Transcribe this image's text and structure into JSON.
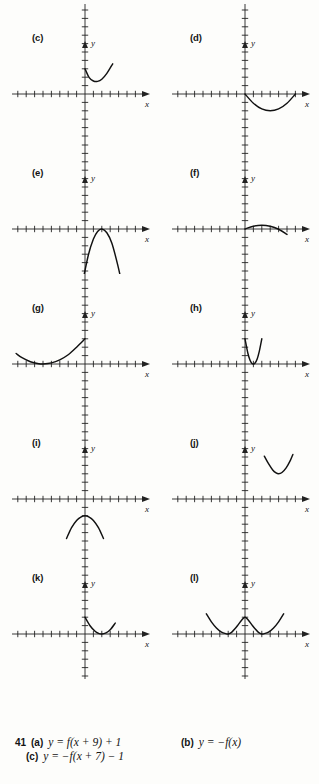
{
  "page": {
    "kind": "textbook-answer-figure",
    "grid": {
      "columns": 2,
      "rows": 6
    }
  },
  "axes_defaults": {
    "x_label": "x",
    "y_label": "y",
    "x_min": -8,
    "x_max": 8,
    "y_min": -8,
    "y_max": 8,
    "tick_spacing": 1,
    "grid": false
  },
  "panels": [
    {
      "id": "c",
      "label": "(c)",
      "chart": {
        "type": "line",
        "title": "",
        "xlabel": "x",
        "ylabel": "y",
        "xlim": [
          -8,
          8
        ],
        "ylim": [
          -8,
          8
        ],
        "description": "upward parabola, vertex near (1.5, 1.5), left end at (0, 3)",
        "vertex": [
          1.5,
          1.5
        ],
        "opens": "up",
        "x_domain": [
          0,
          3.3
        ],
        "a": 1.2,
        "points": [
          [
            0,
            3.0
          ],
          [
            0.5,
            1.95
          ],
          [
            1.0,
            1.55
          ],
          [
            1.5,
            1.5
          ],
          [
            2.0,
            1.75
          ],
          [
            2.6,
            2.45
          ],
          [
            3.3,
            3.6
          ]
        ]
      }
    },
    {
      "id": "d",
      "label": "(d)",
      "chart": {
        "type": "line",
        "title": "",
        "xlabel": "x",
        "ylabel": "y",
        "xlim": [
          -8,
          8
        ],
        "ylim": [
          -8,
          8
        ],
        "description": "upward parabola, vertex near (3, -2), roots at x=0 and x=6",
        "vertex": [
          3,
          -2
        ],
        "opens": "up",
        "x_domain": [
          0,
          6
        ],
        "a": 0.22,
        "points": [
          [
            0,
            0
          ],
          [
            1,
            -1.1
          ],
          [
            2,
            -1.78
          ],
          [
            3,
            -2.0
          ],
          [
            4,
            -1.78
          ],
          [
            5,
            -1.1
          ],
          [
            6,
            0
          ]
        ]
      }
    },
    {
      "id": "e",
      "label": "(e)",
      "chart": {
        "type": "line",
        "title": "",
        "xlabel": "x",
        "ylabel": "y",
        "xlim": [
          -8,
          8
        ],
        "ylim": [
          -8,
          8
        ],
        "description": "downward parabola, vertex at (2, 0) tangent to x-axis, ends near y=-7",
        "vertex": [
          2,
          0
        ],
        "opens": "down",
        "x_domain": [
          -0.4,
          4.6
        ],
        "a": -1.2,
        "points": [
          [
            -0.4,
            -6.9
          ],
          [
            0.4,
            -3.1
          ],
          [
            1.0,
            -1.2
          ],
          [
            1.5,
            -0.3
          ],
          [
            2.0,
            0
          ],
          [
            2.6,
            -0.45
          ],
          [
            3.2,
            -1.7
          ],
          [
            3.9,
            -4.3
          ],
          [
            4.5,
            -7.0
          ]
        ]
      }
    },
    {
      "id": "f",
      "label": "(f)",
      "chart": {
        "type": "line",
        "title": "",
        "xlabel": "x",
        "ylabel": "y",
        "xlim": [
          -8,
          8
        ],
        "ylim": [
          -8,
          8
        ],
        "description": "shallow downward arc, peak near (2, 0.45), from (0, 0) down to (5, -0.7)",
        "vertex": [
          2,
          0.45
        ],
        "opens": "down",
        "x_domain": [
          0,
          5
        ],
        "a": -0.12,
        "points": [
          [
            0,
            0
          ],
          [
            1,
            0.33
          ],
          [
            2,
            0.45
          ],
          [
            3,
            0.33
          ],
          [
            4,
            -0.03
          ],
          [
            5,
            -0.65
          ]
        ]
      }
    },
    {
      "id": "g",
      "label": "(g)",
      "chart": {
        "type": "line",
        "title": "",
        "xlabel": "x",
        "ylabel": "y",
        "xlim": [
          -8,
          8
        ],
        "ylim": [
          -8,
          8
        ],
        "description": "upward parabola, vertex near (-5, 0), rising to (0, 3) on the right and off the left edge",
        "vertex": [
          -5,
          0
        ],
        "opens": "up",
        "x_domain": [
          -8.2,
          0
        ],
        "a": 0.12,
        "points": [
          [
            -8.2,
            1.25
          ],
          [
            -7.5,
            0.75
          ],
          [
            -6.5,
            0.27
          ],
          [
            -5.5,
            0.03
          ],
          [
            -5,
            0
          ],
          [
            -4,
            0.13
          ],
          [
            -3,
            0.5
          ],
          [
            -2,
            1.1
          ],
          [
            -1,
            2.0
          ],
          [
            0,
            3.0
          ]
        ]
      }
    },
    {
      "id": "h",
      "label": "(h)",
      "chart": {
        "type": "line",
        "title": "",
        "xlabel": "x",
        "ylabel": "y",
        "xlim": [
          -8,
          8
        ],
        "ylim": [
          -8,
          8
        ],
        "description": "narrow upward parabola, vertex at (1, 0), both branches rise steeply to about y=3",
        "vertex": [
          1,
          0
        ],
        "opens": "up",
        "x_domain": [
          0,
          2
        ],
        "a": 3.0,
        "points": [
          [
            0,
            3.0
          ],
          [
            0.35,
            1.25
          ],
          [
            0.6,
            0.45
          ],
          [
            0.8,
            0.1
          ],
          [
            1.0,
            0
          ],
          [
            1.2,
            0.12
          ],
          [
            1.45,
            0.6
          ],
          [
            1.7,
            1.5
          ],
          [
            2.0,
            3.0
          ]
        ]
      }
    },
    {
      "id": "i",
      "label": "(i)",
      "chart": {
        "type": "line",
        "title": "",
        "xlabel": "x",
        "ylabel": "y",
        "xlim": [
          -8,
          8
        ],
        "ylim": [
          -8,
          8
        ],
        "description": "downward parabola entirely below the x-axis, peak near (0, -2)",
        "vertex": [
          0,
          -2
        ],
        "opens": "down",
        "x_domain": [
          -2.2,
          2.2
        ],
        "a": -0.55,
        "points": [
          [
            -2.2,
            -4.7
          ],
          [
            -1.6,
            -3.4
          ],
          [
            -1.0,
            -2.55
          ],
          [
            -0.5,
            -2.15
          ],
          [
            0,
            -2.0
          ],
          [
            0.5,
            -2.15
          ],
          [
            1.0,
            -2.55
          ],
          [
            1.6,
            -3.4
          ],
          [
            2.2,
            -4.7
          ]
        ]
      }
    },
    {
      "id": "j",
      "label": "(j)",
      "chart": {
        "type": "line",
        "title": "",
        "xlabel": "x",
        "ylabel": "y",
        "xlim": [
          -8,
          8
        ],
        "ylim": [
          -8,
          8
        ],
        "description": "upward parabola in the first quadrant, vertex near (4, 3), ends near y=5",
        "vertex": [
          4,
          3
        ],
        "opens": "up",
        "x_domain": [
          2.3,
          5.7
        ],
        "a": 0.75,
        "points": [
          [
            2.3,
            5.1
          ],
          [
            2.8,
            4.2
          ],
          [
            3.3,
            3.45
          ],
          [
            3.7,
            3.1
          ],
          [
            4.0,
            3.0
          ],
          [
            4.4,
            3.15
          ],
          [
            4.9,
            3.7
          ],
          [
            5.4,
            4.6
          ],
          [
            5.7,
            5.3
          ]
        ]
      }
    },
    {
      "id": "k",
      "label": "(k)",
      "chart": {
        "type": "line",
        "title": "",
        "xlabel": "x",
        "ylabel": "y",
        "xlim": [
          -8,
          8
        ],
        "ylim": [
          -8,
          8
        ],
        "description": "upward parabola, vertex at (2, 0) tangent to x-axis, left end at (0, 2)",
        "vertex": [
          2,
          0
        ],
        "opens": "up",
        "x_domain": [
          0,
          3.6
        ],
        "a": 0.5,
        "points": [
          [
            0,
            2.0
          ],
          [
            0.6,
            0.98
          ],
          [
            1.2,
            0.32
          ],
          [
            1.6,
            0.08
          ],
          [
            2.0,
            0
          ],
          [
            2.5,
            0.13
          ],
          [
            3.0,
            0.5
          ],
          [
            3.6,
            1.3
          ]
        ]
      }
    },
    {
      "id": "l",
      "label": "(l)",
      "chart": {
        "type": "line",
        "title": "",
        "xlabel": "x",
        "ylabel": "y",
        "xlim": [
          -8,
          8
        ],
        "ylim": [
          -8,
          8
        ],
        "description": "W-shaped curve, minima at x=-2 and x=2 on the x-axis, local peak at (0, 2)",
        "minima": [
          [
            -2,
            0
          ],
          [
            2,
            0
          ]
        ],
        "local_max": [
          0,
          2
        ],
        "opens": "up",
        "x_domain": [
          -4.6,
          4.6
        ],
        "points": [
          [
            -4.6,
            2.4
          ],
          [
            -4.0,
            1.45
          ],
          [
            -3.4,
            0.72
          ],
          [
            -2.8,
            0.22
          ],
          [
            -2.2,
            0.02
          ],
          [
            -2.0,
            0
          ],
          [
            -1.6,
            0.2
          ],
          [
            -1.2,
            0.62
          ],
          [
            -0.8,
            1.12
          ],
          [
            -0.4,
            1.65
          ],
          [
            0,
            2.0
          ],
          [
            0.4,
            1.65
          ],
          [
            0.8,
            1.12
          ],
          [
            1.2,
            0.62
          ],
          [
            1.6,
            0.2
          ],
          [
            2.0,
            0
          ],
          [
            2.2,
            0.02
          ],
          [
            2.8,
            0.22
          ],
          [
            3.4,
            0.72
          ],
          [
            4.0,
            1.45
          ],
          [
            4.6,
            2.4
          ]
        ]
      }
    }
  ],
  "answer_block": {
    "number": "41",
    "items": [
      {
        "tag": "(a)",
        "equation": "y = f(x + 9) + 1"
      },
      {
        "tag": "(b)",
        "equation": "y = −f(x)"
      },
      {
        "tag": "(c)",
        "equation": "y = −f(x + 7) − 1"
      }
    ]
  }
}
